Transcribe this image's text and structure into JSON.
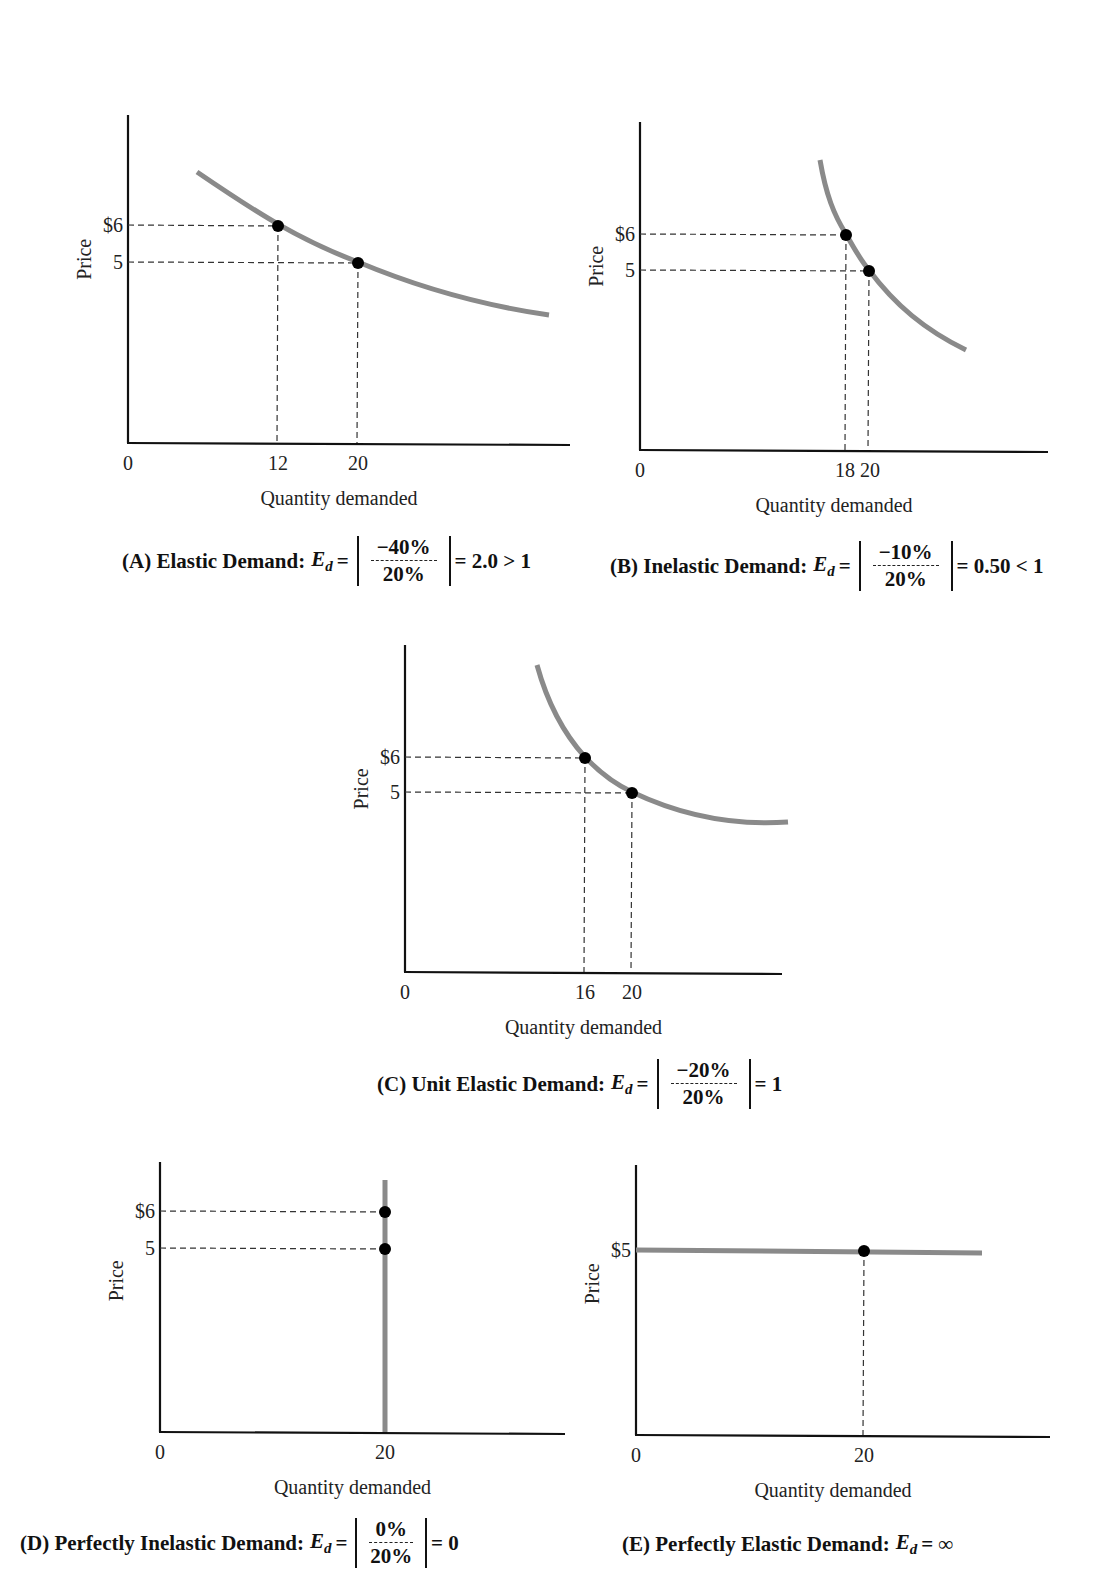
{
  "figure": {
    "panels": [
      {
        "id": "A",
        "caption": {
          "prefix": "(A) Elastic Demand:",
          "ed": "E",
          "ed_sub": "d",
          "eq": "=",
          "numerator": "−40%",
          "denominator": "20%",
          "result": "= 2.0 > 1"
        }
      },
      {
        "id": "B",
        "caption": {
          "prefix": "(B) Inelastic Demand:",
          "ed": "E",
          "ed_sub": "d",
          "eq": "=",
          "numerator": "−10%",
          "denominator": "20%",
          "result": "= 0.50 < 1"
        }
      },
      {
        "id": "C",
        "caption": {
          "prefix": "(C) Unit Elastic Demand:",
          "ed": "E",
          "ed_sub": "d",
          "eq": "=",
          "numerator": "−20%",
          "denominator": "20%",
          "result": "= 1"
        }
      },
      {
        "id": "D",
        "caption": {
          "prefix": "(D) Perfectly Inelastic Demand:",
          "ed": "E",
          "ed_sub": "d",
          "eq": "=",
          "numerator": "0%",
          "denominator": "20%",
          "result": "= 0"
        }
      },
      {
        "id": "E",
        "caption": {
          "prefix": "(E) Perfectly Elastic Demand:",
          "ed": "E",
          "ed_sub": "d",
          "eq": "= ∞"
        }
      }
    ]
  },
  "colors": {
    "curve": "#8a8a8a",
    "axis": "#111111",
    "guide": "#333333",
    "point": "#000000"
  },
  "chart_data": [
    {
      "type": "line",
      "title": "(A) Elastic Demand: Ed = |-40% / 20%| = 2.0 > 1",
      "xlabel": "Quantity demanded",
      "ylabel": "Price",
      "origin_label": "0",
      "x_ticks": [
        "12",
        "20"
      ],
      "y_ticks": [
        "$6",
        "5"
      ],
      "points": [
        {
          "x": 12,
          "y": 6
        },
        {
          "x": 20,
          "y": 5
        }
      ],
      "curve_shape": "gently sloping downward demand curve",
      "elasticity": 2.0,
      "grid": false,
      "layout": {
        "ox": 128,
        "oy": 443,
        "yTop": 115,
        "xRight": 570,
        "tickPx": {
          "x": [
            278,
            358
          ],
          "y": [
            225,
            262
          ]
        },
        "curve": "M197,172 C 260,215 300,240 358,262 C 420,288 480,305 549,315"
      }
    },
    {
      "type": "line",
      "title": "(B) Inelastic Demand: Ed = |-10% / 20%| = 0.50 < 1",
      "xlabel": "Quantity demanded",
      "ylabel": "Price",
      "origin_label": "0",
      "x_ticks": [
        "18",
        "20"
      ],
      "y_ticks": [
        "$6",
        "5"
      ],
      "x_ticks_label": "18 20",
      "points": [
        {
          "x": 18,
          "y": 6
        },
        {
          "x": 20,
          "y": 5
        }
      ],
      "curve_shape": "steep downward demand curve",
      "elasticity": 0.5,
      "grid": false,
      "layout": {
        "ox": 640,
        "oy": 450,
        "yTop": 122,
        "xRight": 1048,
        "tickPx": {
          "x": [
            846,
            869
          ],
          "y": [
            234,
            270
          ]
        },
        "curve": "M820,160 C 826,195 834,215 846,234 C 856,252 862,262 869,270 C 895,305 925,330 966,350"
      }
    },
    {
      "type": "line",
      "title": "(C) Unit Elastic Demand: Ed = |-20% / 20%| = 1",
      "xlabel": "Quantity demanded",
      "ylabel": "Price",
      "origin_label": "0",
      "x_ticks": [
        "16",
        "20"
      ],
      "y_ticks": [
        "$6",
        "5"
      ],
      "points": [
        {
          "x": 16,
          "y": 6
        },
        {
          "x": 20,
          "y": 5
        }
      ],
      "curve_shape": "rectangular-hyperbola demand curve",
      "elasticity": 1,
      "grid": false,
      "layout": {
        "ox": 405,
        "oy": 972,
        "yTop": 645,
        "xRight": 782,
        "tickPx": {
          "x": [
            585,
            632
          ],
          "y": [
            757,
            792
          ]
        },
        "curve": "M537,665 C 548,705 565,735 585,757 C 600,773 615,784 632,792 C 680,815 730,826 788,822"
      }
    },
    {
      "type": "line",
      "title": "(D) Perfectly Inelastic Demand: Ed = |0% / 20%| = 0",
      "xlabel": "Quantity demanded",
      "ylabel": "Price",
      "origin_label": "0",
      "x_ticks": [
        "20"
      ],
      "y_ticks": [
        "$6",
        "5"
      ],
      "points": [
        {
          "x": 20,
          "y": 6
        },
        {
          "x": 20,
          "y": 5
        }
      ],
      "curve_shape": "vertical line at quantity 20",
      "elasticity": 0,
      "grid": false,
      "layout": {
        "ox": 160,
        "oy": 1432,
        "yTop": 1162,
        "xRight": 565,
        "tickPx": {
          "x": [
            385
          ],
          "y": [
            1211,
            1248
          ]
        },
        "curve": "M385,1180 L385,1432"
      }
    },
    {
      "type": "line",
      "title": "(E) Perfectly Elastic Demand: Ed = ∞",
      "xlabel": "Quantity demanded",
      "ylabel": "Price",
      "origin_label": "0",
      "x_ticks": [
        "20"
      ],
      "y_ticks": [
        "$5"
      ],
      "points": [
        {
          "x": 20,
          "y": 5
        }
      ],
      "curve_shape": "horizontal line at price $5",
      "elasticity": "infinity",
      "grid": false,
      "layout": {
        "ox": 636,
        "oy": 1435,
        "yTop": 1165,
        "xRight": 1050,
        "tickPx": {
          "x": [
            864
          ],
          "y": [
            1250
          ]
        },
        "curve": "M636,1250 L982,1253",
        "hideHorizontalGuides": true
      }
    }
  ]
}
